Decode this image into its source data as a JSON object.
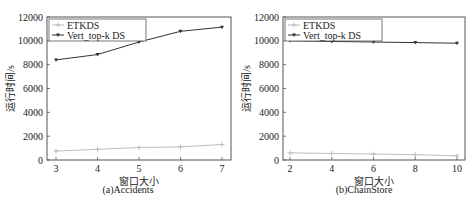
{
  "chart_data": [
    {
      "type": "line",
      "title": "(a)Accidents",
      "xlabel": "窗口大小",
      "ylabel": "运行时间/s",
      "x": [
        3,
        4,
        5,
        6,
        7
      ],
      "xticks": [
        "3",
        "4",
        "5",
        "6",
        "7"
      ],
      "yticks": [
        "0",
        "2000",
        "4000",
        "6000",
        "8000",
        "10000",
        "12000"
      ],
      "ylim": [
        0,
        12000
      ],
      "xlim": [
        2.9,
        7.1
      ],
      "grid": false,
      "legend_position": "upper left",
      "series": [
        {
          "name": "ETKDS",
          "color": "#bdbdbd",
          "marker": "plus",
          "values": [
            750,
            900,
            1050,
            1100,
            1300
          ]
        },
        {
          "name": "Vert_top-k DS",
          "color": "#333333",
          "marker": "triangle-down",
          "values": [
            8400,
            8850,
            9900,
            10800,
            11150
          ]
        }
      ]
    },
    {
      "type": "line",
      "title": "(b)ChainStore",
      "xlabel": "窗口大小",
      "ylabel": "运行时间/s",
      "x": [
        2,
        4,
        6,
        8,
        10
      ],
      "xticks": [
        "2",
        "4",
        "6",
        "8",
        "10"
      ],
      "yticks": [
        "0",
        "2000",
        "4000",
        "6000",
        "8000",
        "10000",
        "12000"
      ],
      "ylim": [
        0,
        12000
      ],
      "xlim": [
        1.8,
        10.2
      ],
      "grid": false,
      "legend_position": "upper left",
      "series": [
        {
          "name": "ETKDS",
          "color": "#bdbdbd",
          "marker": "plus",
          "values": [
            600,
            550,
            500,
            450,
            350
          ]
        },
        {
          "name": "Vert_top-k DS",
          "color": "#333333",
          "marker": "triangle-down",
          "values": [
            10000,
            9950,
            9900,
            9850,
            9800
          ]
        }
      ]
    }
  ],
  "captions": {
    "a": "(a)Accidents",
    "b": "(b)ChainStore"
  },
  "axis": {
    "xlabel": "窗口大小",
    "ylabel": "运行时间/s"
  },
  "legend": {
    "etkds": "ETKDS",
    "vert": "Vert_top-k DS"
  }
}
